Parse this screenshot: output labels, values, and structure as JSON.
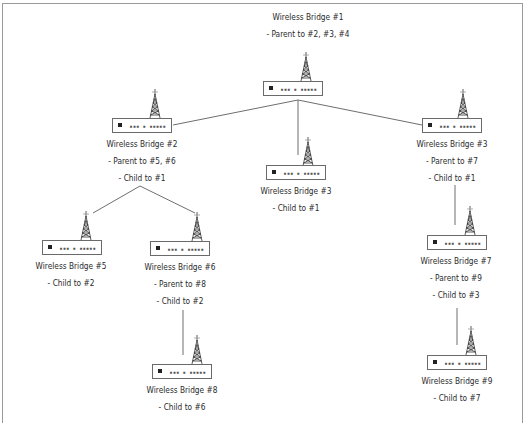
{
  "diagram": {
    "type": "wireless-bridge-hierarchy",
    "colors": {
      "line": "#6e6e6e",
      "frame": "#9a9a9a",
      "text": "#2a2a2a"
    },
    "nodes": [
      {
        "id": "b1",
        "title": "Wireless Bridge #1",
        "lines": [
          "- Parent to #2, #3, #4"
        ],
        "ports": "▪▪▪ ▪ ▪▪▪▪▪"
      },
      {
        "id": "b2",
        "title": "Wireless Bridge #2",
        "lines": [
          "- Parent to #5, #6",
          "- Child to #1"
        ],
        "ports": "▪▪▪ ▪ ▪▪▪▪▪"
      },
      {
        "id": "b3mid",
        "title": "Wireless Bridge #3",
        "lines": [
          "- Child to #1"
        ],
        "ports": "▪▪▪ ▪ ▪▪▪▪▪"
      },
      {
        "id": "b3right",
        "title": "Wireless Bridge #3",
        "lines": [
          "- Parent to #7",
          "- Child to #1"
        ],
        "ports": "▪▪▪ ▪ ▪▪▪▪▪"
      },
      {
        "id": "b5",
        "title": "Wireless Bridge #5",
        "lines": [
          "- Child to #2"
        ],
        "ports": "▪▪▪ ▪ ▪▪▪▪▪"
      },
      {
        "id": "b6",
        "title": "Wireless Bridge #6",
        "lines": [
          "- Parent to #8",
          "- Child to #2"
        ],
        "ports": "▪▪▪ ▪ ▪▪▪▪▪"
      },
      {
        "id": "b7",
        "title": "Wireless Bridge #7",
        "lines": [
          "- Parent to #9",
          "- Child to #3"
        ],
        "ports": "▪▪▪ ▪ ▪▪▪▪▪"
      },
      {
        "id": "b8",
        "title": "Wireless Bridge #8",
        "lines": [
          "- Child to #6"
        ],
        "ports": "▪▪▪ ▪ ▪▪▪▪▪"
      },
      {
        "id": "b9",
        "title": "Wireless Bridge #9",
        "lines": [
          "- Child to #7"
        ],
        "ports": "▪▪▪ ▪ ▪▪▪▪▪"
      }
    ],
    "edges": [
      {
        "from": "Wireless Bridge #1",
        "to": "Wireless Bridge #2"
      },
      {
        "from": "Wireless Bridge #1",
        "to": "Wireless Bridge #3 (center)"
      },
      {
        "from": "Wireless Bridge #1",
        "to": "Wireless Bridge #3 (right)"
      },
      {
        "from": "Wireless Bridge #2",
        "to": "Wireless Bridge #5"
      },
      {
        "from": "Wireless Bridge #2",
        "to": "Wireless Bridge #6"
      },
      {
        "from": "Wireless Bridge #6",
        "to": "Wireless Bridge #8"
      },
      {
        "from": "Wireless Bridge #3 (right)",
        "to": "Wireless Bridge #7"
      },
      {
        "from": "Wireless Bridge #7",
        "to": "Wireless Bridge #9"
      }
    ]
  }
}
